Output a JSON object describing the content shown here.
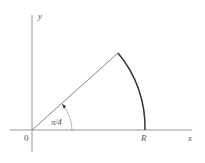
{
  "diagram": {
    "type": "polar-sector",
    "labels": {
      "y_axis": "y",
      "x_axis": "x",
      "origin": "0",
      "radius_point": "R",
      "angle": "π/4"
    },
    "geometry": {
      "origin": [
        32,
        130
      ],
      "x_axis_range": [
        10,
        192
      ],
      "y_axis_range": [
        15,
        152
      ],
      "ray_end": [
        118,
        53
      ],
      "R_point": [
        145,
        130
      ],
      "angle_arc_radius": 40
    },
    "colors": {
      "axis": "#888888",
      "ray": "#777777",
      "sector_arc": "#333333",
      "text": "#555555"
    }
  }
}
